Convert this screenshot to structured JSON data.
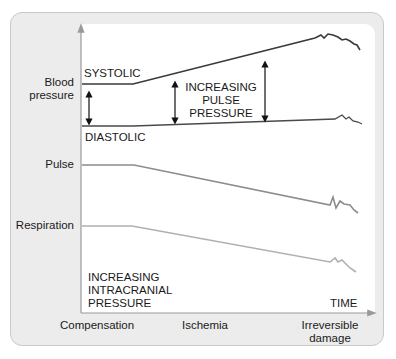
{
  "diagram": {
    "y_labels": {
      "blood_pressure": [
        "Blood",
        "pressure"
      ],
      "pulse": "Pulse",
      "respiration": "Respiration"
    },
    "line_labels": {
      "systolic": "SYSTOLIC",
      "diastolic": "DIASTOLIC"
    },
    "annotation": [
      "INCREASING",
      "PULSE",
      "PRESSURE"
    ],
    "icp_label": [
      "INCREASING",
      "INTRACRANIAL",
      "PRESSURE"
    ],
    "x_axis_label": "TIME",
    "phases": {
      "compensation": "Compensation",
      "ischemia": "Ischemia",
      "irreversible": [
        "Irreversible",
        "damage"
      ]
    },
    "colors": {
      "bp_line": "#3a3a3a",
      "pulse_line": "#8c8c8c",
      "respiration_line": "#a9a9a9",
      "axis": "#9a9a9a",
      "frame": "#ececec"
    }
  }
}
